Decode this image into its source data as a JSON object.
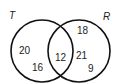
{
  "diagram": {
    "type": "venn",
    "sets": [
      {
        "name": "T",
        "label": "T",
        "only_values": [
          "20",
          "16"
        ]
      },
      {
        "name": "R",
        "label": "R",
        "only_values": [
          "18",
          "21",
          "9"
        ]
      }
    ],
    "intersection_values": [
      "12"
    ],
    "colors": {
      "stroke": "#111111",
      "text": "#222222",
      "background": "#ffffff"
    }
  }
}
